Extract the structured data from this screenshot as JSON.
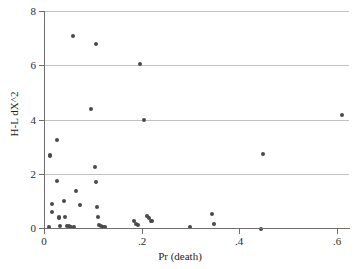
{
  "chart_data": {
    "type": "scatter",
    "title": "",
    "xlabel": "Pr (death)",
    "ylabel": "H-L dX^2",
    "xlim": [
      0,
      0.625
    ],
    "ylim": [
      0,
      8
    ],
    "xticks": [
      0,
      0.2,
      0.4,
      0.6
    ],
    "xtick_labels": [
      "0",
      ".2",
      ".4",
      ".6"
    ],
    "yticks": [
      0,
      2,
      4,
      6,
      8
    ],
    "ytick_labels": [
      "0",
      "2",
      "4",
      "6",
      "8"
    ],
    "grid": "horizontal",
    "legend": "none",
    "marker_color": "#4a4a4a",
    "axis_color": "#6f6f6f",
    "grid_color": "#c2c2c2",
    "points": [
      {
        "x": 0.01,
        "y": 0.02
      },
      {
        "x": 0.012,
        "y": 2.7
      },
      {
        "x": 0.013,
        "y": 2.66
      },
      {
        "x": 0.016,
        "y": 0.9
      },
      {
        "x": 0.017,
        "y": 0.58
      },
      {
        "x": 0.026,
        "y": 3.24
      },
      {
        "x": 0.027,
        "y": 1.74
      },
      {
        "x": 0.03,
        "y": 0.42
      },
      {
        "x": 0.031,
        "y": 0.38
      },
      {
        "x": 0.033,
        "y": 0.06
      },
      {
        "x": 0.04,
        "y": 0.99
      },
      {
        "x": 0.044,
        "y": 0.4
      },
      {
        "x": 0.048,
        "y": 0.08
      },
      {
        "x": 0.052,
        "y": 0.06
      },
      {
        "x": 0.056,
        "y": 0.05
      },
      {
        "x": 0.06,
        "y": 7.08
      },
      {
        "x": 0.061,
        "y": 0.04
      },
      {
        "x": 0.066,
        "y": 1.38
      },
      {
        "x": 0.073,
        "y": 0.86
      },
      {
        "x": 0.097,
        "y": 4.38
      },
      {
        "x": 0.104,
        "y": 2.24
      },
      {
        "x": 0.106,
        "y": 6.78
      },
      {
        "x": 0.107,
        "y": 1.7
      },
      {
        "x": 0.108,
        "y": 0.76
      },
      {
        "x": 0.11,
        "y": 0.42
      },
      {
        "x": 0.113,
        "y": 0.1
      },
      {
        "x": 0.116,
        "y": 0.07
      },
      {
        "x": 0.121,
        "y": 0.05
      },
      {
        "x": 0.126,
        "y": 0.04
      },
      {
        "x": 0.185,
        "y": 0.24
      },
      {
        "x": 0.189,
        "y": 0.14
      },
      {
        "x": 0.193,
        "y": 0.12
      },
      {
        "x": 0.196,
        "y": 6.03
      },
      {
        "x": 0.205,
        "y": 3.99
      },
      {
        "x": 0.212,
        "y": 0.44
      },
      {
        "x": 0.216,
        "y": 0.38
      },
      {
        "x": 0.219,
        "y": 0.26
      },
      {
        "x": 0.222,
        "y": 0.25
      },
      {
        "x": 0.299,
        "y": 0.02
      },
      {
        "x": 0.344,
        "y": 0.5
      },
      {
        "x": 0.348,
        "y": 0.16
      },
      {
        "x": 0.448,
        "y": 2.72
      },
      {
        "x": 0.444,
        "y": -0.02
      },
      {
        "x": 0.61,
        "y": 4.15
      }
    ]
  }
}
